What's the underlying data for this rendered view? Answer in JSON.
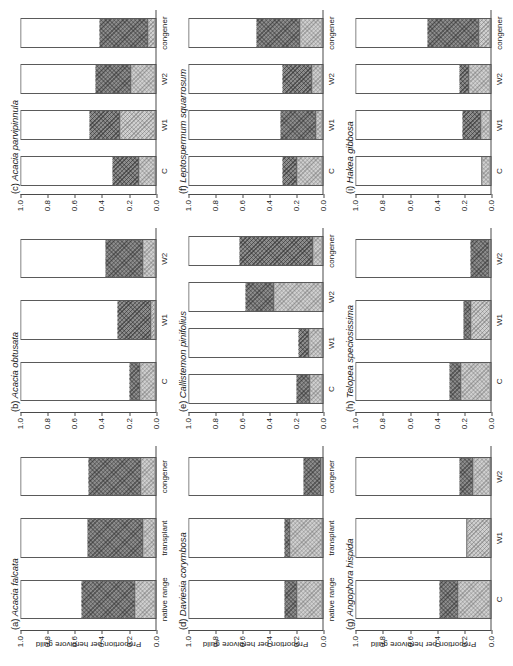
{
  "figure": {
    "axis_label": "Proportion per herbivore guild",
    "y_ticks": [
      "1.0",
      "0.8",
      "0.6",
      "0.4",
      "0.2",
      "0.0"
    ],
    "colors": {
      "guild_dark": "#8d8d8d",
      "guild_light": "#cfcfcf",
      "remainder": "#ffffff",
      "axis": "#4a4a4a"
    }
  },
  "chart_data": {
    "type": "bar",
    "title": "Proportion per herbivore guild",
    "xlabel": "",
    "ylabel": "Proportion per herbivore guild",
    "ylim": [
      0.0,
      1.0
    ],
    "grid": false,
    "legend": "none",
    "stacked": true,
    "series": [
      {
        "name": "guild-dark"
      },
      {
        "name": "guild-light"
      }
    ],
    "panels": [
      {
        "key": "a",
        "letter": "(a)",
        "species": "Acacia falcata",
        "categories": [
          "native range",
          "transplant",
          "congener"
        ],
        "values_dark": [
          0.4,
          0.42,
          0.4
        ],
        "values_light": [
          0.15,
          0.09,
          0.1
        ],
        "tops": [
          0.55,
          0.51,
          0.5
        ]
      },
      {
        "key": "b",
        "letter": "(b)",
        "species": "Acacia obtusata",
        "categories": [
          "C",
          "W1",
          "W2"
        ],
        "values_dark": [
          0.08,
          0.25,
          0.28
        ],
        "values_light": [
          0.11,
          0.03,
          0.09
        ],
        "tops": [
          0.19,
          0.28,
          0.37
        ],
        "extra_category": "congener",
        "extra_dark": 0.4,
        "extra_light": 0.04,
        "extra_top": 0.44
      },
      {
        "key": "c",
        "letter": "(c)",
        "species": "Acacia parvipinnula",
        "categories": [
          "C",
          "W1",
          "W2",
          "congener"
        ],
        "values_dark": [
          0.2,
          0.23,
          0.27,
          0.37
        ],
        "values_light": [
          0.12,
          0.26,
          0.18,
          0.05
        ],
        "tops": [
          0.32,
          0.49,
          0.45,
          0.42
        ]
      },
      {
        "key": "d",
        "letter": "(d)",
        "species": "Daviesia corymbosa",
        "categories": [
          "native range",
          "transplant",
          "congener"
        ],
        "values_dark": [
          0.1,
          0.05,
          0.14
        ],
        "values_light": [
          0.19,
          0.24,
          0.0
        ],
        "tops": [
          0.29,
          0.29,
          0.14
        ]
      },
      {
        "key": "e",
        "letter": "(e)",
        "species": "Callistemon pinifolius",
        "categories": [
          "C",
          "W1",
          "W2",
          "congener"
        ],
        "values_dark": [
          0.11,
          0.08,
          0.22,
          0.55
        ],
        "values_light": [
          0.09,
          0.1,
          0.36,
          0.07
        ],
        "tops": [
          0.2,
          0.18,
          0.58,
          0.72
        ]
      },
      {
        "key": "f",
        "letter": "(f)",
        "species": "Leptospermum squarrosum",
        "categories": [
          "C",
          "W1",
          "W2",
          "congener"
        ],
        "values_dark": [
          0.11,
          0.27,
          0.22,
          0.33
        ],
        "values_light": [
          0.19,
          0.05,
          0.08,
          0.17
        ],
        "tops": [
          0.3,
          0.32,
          0.3,
          0.5
        ]
      },
      {
        "key": "g",
        "letter": "(g)",
        "species": "Angophora hispida",
        "categories": [
          "C",
          "W1",
          "W2"
        ],
        "values_dark": [
          0.14,
          0.0,
          0.1
        ],
        "values_light": [
          0.24,
          0.17,
          0.13
        ],
        "tops": [
          0.38,
          0.17,
          0.23
        ]
      },
      {
        "key": "h",
        "letter": "(h)",
        "species": "Telopea speciosissima",
        "categories": [
          "C",
          "W1",
          "W2"
        ],
        "values_dark": [
          0.09,
          0.06,
          0.14
        ],
        "values_light": [
          0.22,
          0.14,
          0.0
        ],
        "tops": [
          0.31,
          0.2,
          0.14
        ]
      },
      {
        "key": "i",
        "letter": "(i)",
        "species": "Hakea gibbosa",
        "categories": [
          "C",
          "W1",
          "W2",
          "congener"
        ],
        "values_dark": [
          0.01,
          0.14,
          0.07,
          0.39
        ],
        "values_light": [
          0.06,
          0.07,
          0.16,
          0.08
        ],
        "tops": [
          0.07,
          0.21,
          0.23,
          0.47
        ]
      }
    ]
  }
}
